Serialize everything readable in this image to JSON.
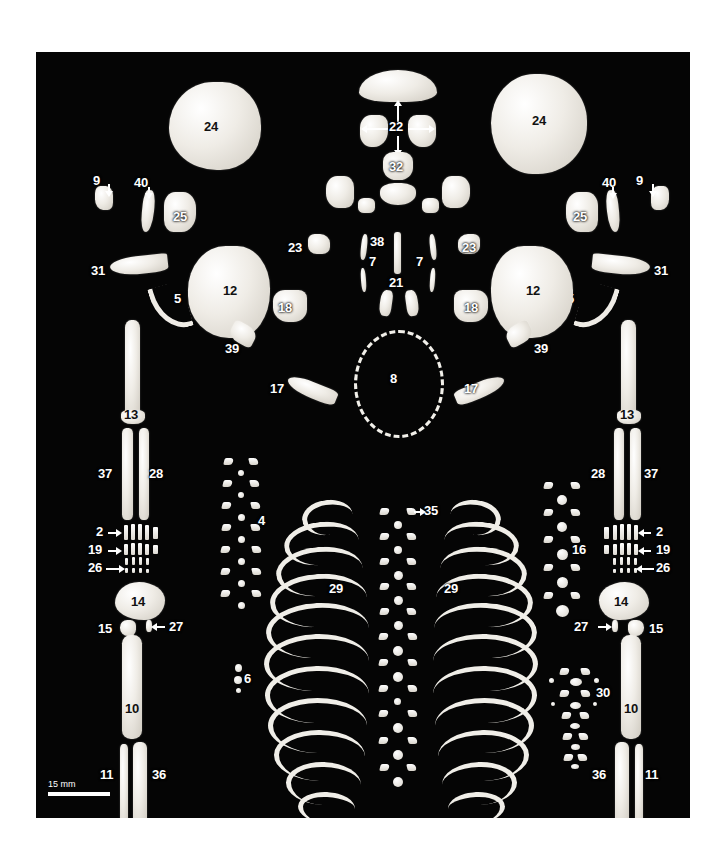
{
  "figure": {
    "background_color": "#050505",
    "bone_color": "#efece6",
    "label_color": "#ffffff",
    "scale_bar": {
      "caption": "15 mm"
    }
  },
  "labels": {
    "l1": "1",
    "l2": "2",
    "l4": "4",
    "l5": "5",
    "l6": "6",
    "l7": "7",
    "l8": "8",
    "l9": "9",
    "l10": "10",
    "l11": "11",
    "l12": "12",
    "l13": "13",
    "l14": "14",
    "l15": "15",
    "l16": "16",
    "l17": "17",
    "l18": "18",
    "l19": "19",
    "l20": "20",
    "l21": "21",
    "l22": "22",
    "l23": "23",
    "l24": "24",
    "l25": "25",
    "l26": "26",
    "l27": "27",
    "l28": "28",
    "l29": "29",
    "l30": "30",
    "l31": "31",
    "l32": "32",
    "l33": "33",
    "l34": "34",
    "l35": "35",
    "l36": "36",
    "l37": "37",
    "l38": "38",
    "l39": "39",
    "l40": "40"
  },
  "label_list": [
    {
      "id": "1",
      "name": "patella"
    },
    {
      "id": "2",
      "name": "metacarpal"
    },
    {
      "id": "4",
      "name": "cervical-vertebra"
    },
    {
      "id": "5",
      "name": "clavicle"
    },
    {
      "id": "6",
      "name": "hyoid"
    },
    {
      "id": "7",
      "name": "rib-first"
    },
    {
      "id": "8",
      "name": "cranial-outline"
    },
    {
      "id": "9",
      "name": "ethmoid"
    },
    {
      "id": "10",
      "name": "femur"
    },
    {
      "id": "11",
      "name": "fibula"
    },
    {
      "id": "12",
      "name": "parietal"
    },
    {
      "id": "13",
      "name": "humerus"
    },
    {
      "id": "14",
      "name": "ilium"
    },
    {
      "id": "15",
      "name": "ischium"
    },
    {
      "id": "16",
      "name": "lumbar-vertebra"
    },
    {
      "id": "17",
      "name": "mandible-half"
    },
    {
      "id": "18",
      "name": "temporal"
    },
    {
      "id": "19",
      "name": "hand-phalanx-proximal"
    },
    {
      "id": "20",
      "name": "metatarsal"
    },
    {
      "id": "21",
      "name": "maxilla"
    },
    {
      "id": "22",
      "name": "frontal"
    },
    {
      "id": "23",
      "name": "sphenoid-wing"
    },
    {
      "id": "24",
      "name": "occipital-squama"
    },
    {
      "id": "25",
      "name": "petrous"
    },
    {
      "id": "26",
      "name": "distal-phalanx"
    },
    {
      "id": "27",
      "name": "pubis"
    },
    {
      "id": "28",
      "name": "radius"
    },
    {
      "id": "29",
      "name": "rib"
    },
    {
      "id": "30",
      "name": "sacrum"
    },
    {
      "id": "31",
      "name": "scapula"
    },
    {
      "id": "32",
      "name": "basioccipital"
    },
    {
      "id": "33",
      "name": "calcaneus"
    },
    {
      "id": "34",
      "name": "foot-phalanx"
    },
    {
      "id": "35",
      "name": "thoracic-vertebra"
    },
    {
      "id": "36",
      "name": "tibia"
    },
    {
      "id": "37",
      "name": "ulna"
    },
    {
      "id": "38",
      "name": "vomer"
    },
    {
      "id": "39",
      "name": "zygomatic"
    },
    {
      "id": "40",
      "name": "nasal"
    }
  ]
}
